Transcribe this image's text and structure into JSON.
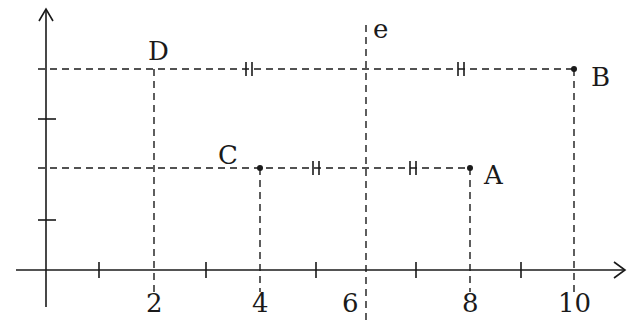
{
  "diagram": {
    "title": "",
    "axes": {
      "x_ticks": [
        {
          "value": 1,
          "label": ""
        },
        {
          "value": 2,
          "label": "2"
        },
        {
          "value": 3,
          "label": ""
        },
        {
          "value": 4,
          "label": "4"
        },
        {
          "value": 5,
          "label": ""
        },
        {
          "value": 6,
          "label": "6"
        },
        {
          "value": 7,
          "label": ""
        },
        {
          "value": 8,
          "label": "8"
        },
        {
          "value": 9,
          "label": ""
        },
        {
          "value": 10,
          "label": "10"
        }
      ],
      "y_ticks": [
        1,
        2,
        3,
        4
      ]
    },
    "points": [
      {
        "name": "A",
        "x": 8,
        "y": 2
      },
      {
        "name": "B",
        "x": 10,
        "y": 4
      },
      {
        "name": "C",
        "x": 4,
        "y": 2
      },
      {
        "name": "D",
        "x": 2,
        "y": 4
      }
    ],
    "line_label": "e",
    "line_x": 6,
    "colors": {
      "ink": "#1a1a1a",
      "background": "#ffffff"
    }
  }
}
